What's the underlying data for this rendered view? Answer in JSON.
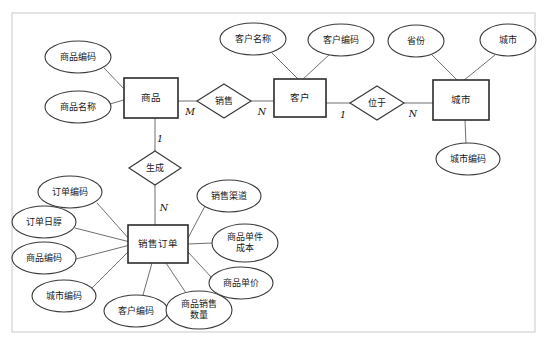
{
  "diagram": {
    "type": "entity-relationship-diagram",
    "frame": {
      "x": 12,
      "y": 13,
      "width": 523,
      "height": 319,
      "border_color": "#c9c9c9",
      "fill": "#ffffff"
    },
    "entities": [
      {
        "id": "product",
        "label": "商品",
        "x": 151,
        "y": 98,
        "w": 54,
        "h": 40
      },
      {
        "id": "customer",
        "label": "客户",
        "x": 300,
        "y": 98,
        "w": 52,
        "h": 38
      },
      {
        "id": "city",
        "label": "城市",
        "x": 461,
        "y": 100,
        "w": 56,
        "h": 40
      },
      {
        "id": "order",
        "label": "销售订单",
        "x": 158,
        "y": 244,
        "w": 60,
        "h": 38
      }
    ],
    "relationships": [
      {
        "id": "sell",
        "label": "销售",
        "x": 224,
        "y": 101,
        "rx": 27,
        "ry": 17
      },
      {
        "id": "locate",
        "label": "位于",
        "x": 377,
        "y": 103,
        "rx": 27,
        "ry": 17
      },
      {
        "id": "generate",
        "label": "生成",
        "x": 155,
        "y": 168,
        "rx": 26,
        "ry": 17
      }
    ],
    "cardinalities": [
      {
        "id": "sell-product-card",
        "text": "M",
        "x": 190,
        "y": 112
      },
      {
        "id": "sell-customer-card",
        "text": "N",
        "x": 262,
        "y": 112
      },
      {
        "id": "locate-customer-card",
        "text": "1",
        "x": 343,
        "y": 115
      },
      {
        "id": "locate-city-card",
        "text": "N",
        "x": 413,
        "y": 114
      },
      {
        "id": "generate-product-card",
        "text": "1",
        "x": 160,
        "y": 139
      },
      {
        "id": "generate-order-card",
        "text": "N",
        "x": 164,
        "y": 208
      }
    ],
    "attributes": [
      {
        "id": "product-code",
        "label": "商品编码",
        "owner": "product",
        "x": 78,
        "y": 57,
        "rx": 33,
        "ry": 16,
        "lines": [
          "商品编码"
        ]
      },
      {
        "id": "product-name",
        "label": "商品名称",
        "owner": "product",
        "x": 78,
        "y": 107,
        "rx": 33,
        "ry": 16,
        "lines": [
          "商品名称"
        ]
      },
      {
        "id": "customer-name",
        "label": "客户名称",
        "owner": "customer",
        "x": 253,
        "y": 39,
        "rx": 33,
        "ry": 16,
        "lines": [
          "客户名称"
        ]
      },
      {
        "id": "customer-code",
        "label": "客户编码",
        "owner": "customer",
        "x": 341,
        "y": 40,
        "rx": 33,
        "ry": 16,
        "lines": [
          "客户编码"
        ]
      },
      {
        "id": "province",
        "label": "省份",
        "owner": "city",
        "x": 416,
        "y": 41,
        "rx": 28,
        "ry": 16,
        "lines": [
          "省份"
        ]
      },
      {
        "id": "city-name",
        "label": "城市",
        "owner": "city",
        "x": 508,
        "y": 40,
        "rx": 28,
        "ry": 16,
        "lines": [
          "城市"
        ]
      },
      {
        "id": "city-code",
        "label": "城市编码",
        "owner": "city",
        "x": 468,
        "y": 159,
        "rx": 32,
        "ry": 16,
        "lines": [
          "城市编码"
        ]
      },
      {
        "id": "order-code",
        "label": "订单编码",
        "owner": "order",
        "x": 70,
        "y": 192,
        "rx": 32,
        "ry": 16,
        "lines": [
          "订单编码"
        ]
      },
      {
        "id": "order-date",
        "label": "订单日朜",
        "owner": "order",
        "x": 44,
        "y": 222,
        "rx": 32,
        "ry": 16,
        "lines": [
          "订单日朜"
        ]
      },
      {
        "id": "order-product-code",
        "label": "商品编码",
        "owner": "order",
        "x": 44,
        "y": 258,
        "rx": 32,
        "ry": 16,
        "lines": [
          "商品编码"
        ]
      },
      {
        "id": "order-city-code",
        "label": "城市编码",
        "owner": "order",
        "x": 64,
        "y": 296,
        "rx": 32,
        "ry": 16,
        "lines": [
          "城市编码"
        ]
      },
      {
        "id": "order-customer-code",
        "label": "客户编码",
        "owner": "order",
        "x": 136,
        "y": 311,
        "rx": 32,
        "ry": 16,
        "lines": [
          "客户编码"
        ]
      },
      {
        "id": "sale-quantity",
        "label": "商品销售数量",
        "owner": "order",
        "x": 199,
        "y": 310,
        "rx": 33,
        "ry": 19,
        "lines": [
          "商品销售",
          "数量"
        ]
      },
      {
        "id": "sale-channel",
        "label": "销售渠道",
        "owner": "order",
        "x": 229,
        "y": 196,
        "rx": 32,
        "ry": 16,
        "lines": [
          "销售渠道"
        ]
      },
      {
        "id": "unit-cost",
        "label": "商品单件成本",
        "owner": "order",
        "x": 245,
        "y": 243,
        "rx": 33,
        "ry": 19,
        "lines": [
          "商品单件",
          "成本"
        ]
      },
      {
        "id": "unit-price",
        "label": "商品单价",
        "owner": "order",
        "x": 241,
        "y": 283,
        "rx": 32,
        "ry": 16,
        "lines": [
          "商品单价"
        ]
      }
    ],
    "links": [
      {
        "id": "link-product-code",
        "x1": 104,
        "y1": 68,
        "x2": 127,
        "y2": 92
      },
      {
        "id": "link-product-name",
        "x1": 110,
        "y1": 104,
        "x2": 127,
        "y2": 99
      },
      {
        "id": "link-product-sell",
        "x1": 178,
        "y1": 101,
        "x2": 197,
        "y2": 101
      },
      {
        "id": "link-sell-customer",
        "x1": 251,
        "y1": 101,
        "x2": 275,
        "y2": 101
      },
      {
        "id": "link-customer-name",
        "x1": 272,
        "y1": 53,
        "x2": 299,
        "y2": 80
      },
      {
        "id": "link-customer-code",
        "x1": 330,
        "y1": 54,
        "x2": 302,
        "y2": 80
      },
      {
        "id": "link-customer-locate",
        "x1": 326,
        "y1": 103,
        "x2": 350,
        "y2": 103
      },
      {
        "id": "link-locate-city",
        "x1": 404,
        "y1": 103,
        "x2": 433,
        "y2": 103
      },
      {
        "id": "link-province-city",
        "x1": 432,
        "y1": 55,
        "x2": 458,
        "y2": 81
      },
      {
        "id": "link-cityname-city",
        "x1": 495,
        "y1": 55,
        "x2": 463,
        "y2": 81
      },
      {
        "id": "link-city-citycode",
        "x1": 465,
        "y1": 120,
        "x2": 466,
        "y2": 144
      },
      {
        "id": "link-product-generate",
        "x1": 155,
        "y1": 118,
        "x2": 155,
        "y2": 152
      },
      {
        "id": "link-generate-order",
        "x1": 155,
        "y1": 185,
        "x2": 155,
        "y2": 226
      },
      {
        "id": "link-ordercode-order",
        "x1": 97,
        "y1": 203,
        "x2": 130,
        "y2": 240
      },
      {
        "id": "link-orderdate-order",
        "x1": 75,
        "y1": 228,
        "x2": 130,
        "y2": 242
      },
      {
        "id": "link-orderprod-order",
        "x1": 76,
        "y1": 259,
        "x2": 130,
        "y2": 245
      },
      {
        "id": "link-ordercity-order",
        "x1": 92,
        "y1": 288,
        "x2": 130,
        "y2": 250
      },
      {
        "id": "link-ordercust-order",
        "x1": 143,
        "y1": 295,
        "x2": 152,
        "y2": 263
      },
      {
        "id": "link-qty-order",
        "x1": 186,
        "y1": 293,
        "x2": 166,
        "y2": 263
      },
      {
        "id": "link-channel-order",
        "x1": 205,
        "y1": 206,
        "x2": 188,
        "y2": 238
      },
      {
        "id": "link-unitcost-order",
        "x1": 212,
        "y1": 243,
        "x2": 188,
        "y2": 244
      },
      {
        "id": "link-unitprice-order",
        "x1": 212,
        "y1": 278,
        "x2": 188,
        "y2": 252
      }
    ]
  }
}
